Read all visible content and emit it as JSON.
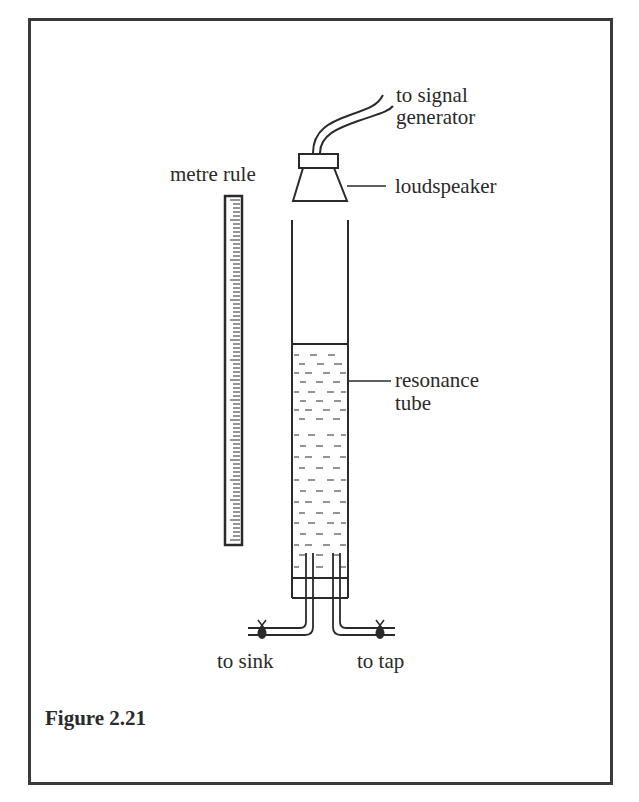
{
  "figure": {
    "caption": "Figure 2.21",
    "labels": {
      "signal_line1": "to signal",
      "signal_line2": "generator",
      "loudspeaker": "loudspeaker",
      "metre_rule": "metre rule",
      "resonance_line1": "resonance",
      "resonance_line2": "tube",
      "to_sink": "to sink",
      "to_tap": "to tap"
    }
  },
  "colors": {
    "ink": "#2a2a2a",
    "frame": "#3a3a3a",
    "background": "#ffffff"
  }
}
